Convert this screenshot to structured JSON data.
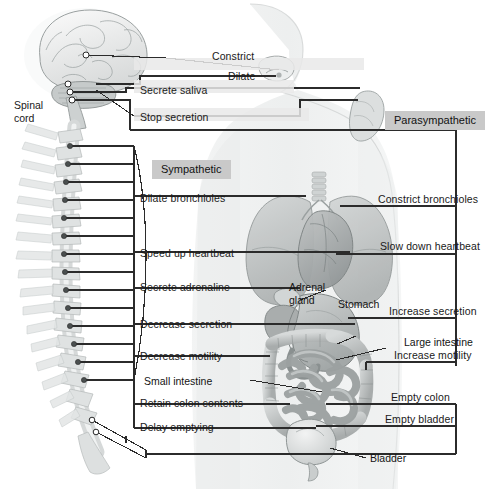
{
  "diagram": {
    "divisions": {
      "sympathetic": "Sympathetic",
      "parasympathetic": "Parasympathetic"
    },
    "spinal_label_line1": "Spinal",
    "spinal_label_line2": "cord",
    "sympathetic_effects": [
      {
        "id": "eye",
        "label": "Dilate"
      },
      {
        "id": "salivary",
        "label": "Stop secretion"
      },
      {
        "id": "bronchi",
        "label": "Dilate bronchioles"
      },
      {
        "id": "heart",
        "label": "Speed up heartbeat"
      },
      {
        "id": "adrenal",
        "label": "Secrete adrenaline"
      },
      {
        "id": "stomach",
        "label": "Decrease secretion"
      },
      {
        "id": "intestine",
        "label": "Decrease motility"
      },
      {
        "id": "colon",
        "label": "Retain colon contents"
      },
      {
        "id": "bladder",
        "label": "Delay emptying"
      }
    ],
    "parasympathetic_effects": [
      {
        "id": "eye",
        "label": "Constrict"
      },
      {
        "id": "salivary",
        "label": "Secrete saliva"
      },
      {
        "id": "bronchi",
        "label": "Constrict bronchioles"
      },
      {
        "id": "heart",
        "label": "Slow down heartbeat"
      },
      {
        "id": "stomach",
        "label": "Increase secretion"
      },
      {
        "id": "intestine",
        "label": "Increase motility"
      },
      {
        "id": "colon",
        "label": "Empty colon"
      },
      {
        "id": "bladder",
        "label": "Empty bladder"
      }
    ],
    "organ_labels": [
      {
        "id": "adrenal-1",
        "label": "Adrenal"
      },
      {
        "id": "adrenal-2",
        "label": "gland"
      },
      {
        "id": "stomach",
        "label": "Stomach"
      },
      {
        "id": "large-intestine",
        "label": "Large intestine"
      },
      {
        "id": "small-intestine",
        "label": "Small intestine"
      },
      {
        "id": "bladder",
        "label": "Bladder"
      }
    ],
    "colors": {
      "band": "#e9e9e9",
      "chip": "#c9c9c9",
      "line": "#2b2b2b",
      "text": "#1a1a1a",
      "body": "#e4e6e6",
      "organ": "#b9bcbc"
    }
  }
}
